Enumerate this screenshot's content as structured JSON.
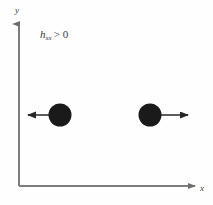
{
  "figure": {
    "background_color": "#fefefe",
    "axis_color": "#7c7c7c",
    "marker_color": "#1a1a1a",
    "arrow_color": "#262626",
    "text_color": "#3a3a3a",
    "axes": {
      "origin": {
        "x": 19,
        "y": 186
      },
      "y_axis": {
        "label": "y",
        "from_y": 186,
        "to_y": 22
      },
      "x_axis": {
        "label": "x",
        "from_x": 19,
        "to_x": 197
      }
    },
    "annotation": {
      "symbol": "h",
      "subscript": "xx",
      "relation": ">",
      "value": "0",
      "full_text": "h_xx > 0"
    },
    "particles": [
      {
        "name": "left-particle",
        "center": {
          "x": 60,
          "y": 115
        },
        "radius": 11,
        "arrow_direction": "left",
        "arrow_from_x": 60,
        "arrow_to_x": 26
      },
      {
        "name": "right-particle",
        "center": {
          "x": 150,
          "y": 115
        },
        "radius": 11,
        "arrow_direction": "right",
        "arrow_from_x": 150,
        "arrow_to_x": 190
      }
    ]
  }
}
